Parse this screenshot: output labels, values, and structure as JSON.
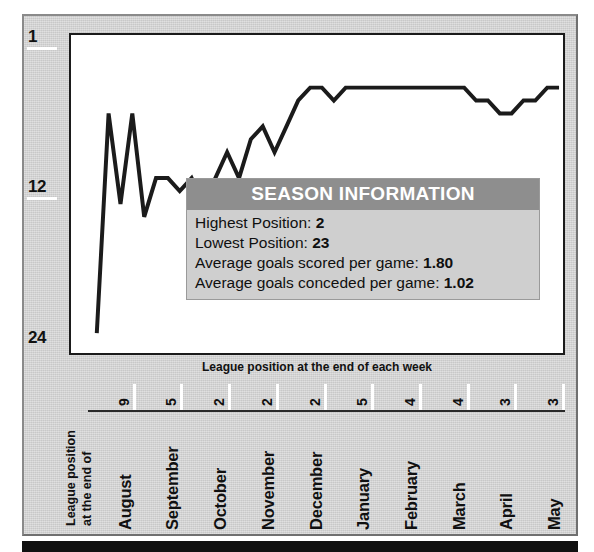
{
  "chart_data": {
    "type": "line",
    "title": "",
    "xlabel": "League position at the end of each week",
    "ylabel": "League position at the end of",
    "ylim": [
      1,
      26
    ],
    "y_inverted": true,
    "y_ticks": [
      "1",
      "12",
      "24"
    ],
    "y_tick_values": [
      1,
      12,
      24
    ],
    "grid": false,
    "legend": "none",
    "series_name": "League position",
    "x_group_labels": [
      {
        "month": "August",
        "week": "9"
      },
      {
        "month": "September",
        "week": "5"
      },
      {
        "month": "October",
        "week": "2"
      },
      {
        "month": "November",
        "week": "2"
      },
      {
        "month": "December",
        "week": "2"
      },
      {
        "month": "January",
        "week": "5"
      },
      {
        "month": "February",
        "week": "4"
      },
      {
        "month": "March",
        "week": "4"
      },
      {
        "month": "April",
        "week": "3"
      },
      {
        "month": "May",
        "week": "3"
      }
    ],
    "values": [
      23,
      6,
      13,
      6,
      14,
      11,
      11,
      12,
      11,
      13,
      11,
      9,
      11,
      8,
      7,
      9,
      7,
      5,
      4,
      4,
      5,
      4,
      4,
      4,
      4,
      4,
      4,
      4,
      4,
      4,
      4,
      4,
      5,
      5,
      6,
      6,
      5,
      5,
      4,
      4
    ],
    "n_points": 40
  },
  "axes": {
    "y_labels": [
      {
        "text": "1",
        "value": 1
      },
      {
        "text": "12",
        "value": 12
      },
      {
        "text": "24",
        "value": 24
      }
    ],
    "y_title_line1": "League position",
    "y_title_line2": "at the end of",
    "x_caption": "League position at the end of each week"
  },
  "info_panel": {
    "title": "SEASON INFORMATION",
    "rows": [
      {
        "label": "Highest Position:",
        "value": "2"
      },
      {
        "label": "Lowest Position:",
        "value": "23"
      },
      {
        "label": "Average goals scored per game:",
        "value": "1.80"
      },
      {
        "label": "Average goals conceded per game:",
        "value": "1.02"
      }
    ]
  },
  "colors": {
    "frame_bg": "#d0d0d0",
    "plot_bg": "#ffffff",
    "line": "#1b1b1b",
    "info_header_bg": "#8e8e8e",
    "info_body_bg": "#cfcfcf",
    "bottom_bar": "#101010"
  }
}
